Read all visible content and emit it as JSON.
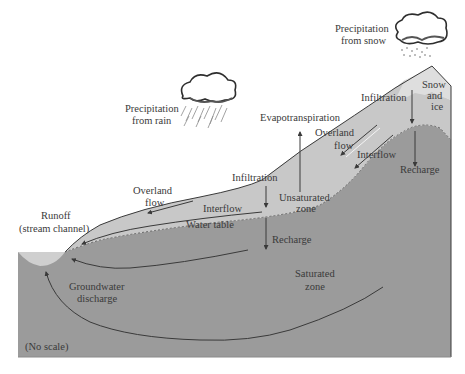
{
  "diagram": {
    "type": "hydrologic cycle cross-section",
    "colors": {
      "background": "#ffffff",
      "saturated_zone": "#9b9b9b",
      "unsaturated_zone": "#c8c8c8",
      "snow_ice": "#dedede",
      "stream": "#cfcfcf",
      "lines": "#3a3a3a",
      "text": "#3a3a3a"
    },
    "labels": {
      "precip_rain_line1": "Precipitation",
      "precip_rain_line2": "from rain",
      "precip_snow_line1": "Precipitation",
      "precip_snow_line2": "from snow",
      "snow_line1": "Snow",
      "snow_line2": "and",
      "snow_line3": "ice",
      "infiltration_mountain": "Infiltration",
      "evapotranspiration": "Evapotranspiration",
      "overland_flow_upper_line1": "Overland",
      "overland_flow_upper_line2": "flow",
      "interflow_upper": "Interflow",
      "recharge_upper": "Recharge",
      "infiltration_mid": "Infiltration",
      "unsaturated_line1": "Unsaturated",
      "unsaturated_line2": "zone",
      "overland_flow_lower_line1": "Overland",
      "overland_flow_lower_line2": "flow",
      "interflow_lower": "Interflow",
      "water_table": "Water table",
      "recharge_lower": "Recharge",
      "runoff_line1": "Runoff",
      "runoff_line2": "(stream channel)",
      "groundwater_line1": "Groundwater",
      "groundwater_line2": "discharge",
      "saturated_line1": "Saturated",
      "saturated_line2": "zone",
      "no_scale": "(No scale)"
    }
  }
}
